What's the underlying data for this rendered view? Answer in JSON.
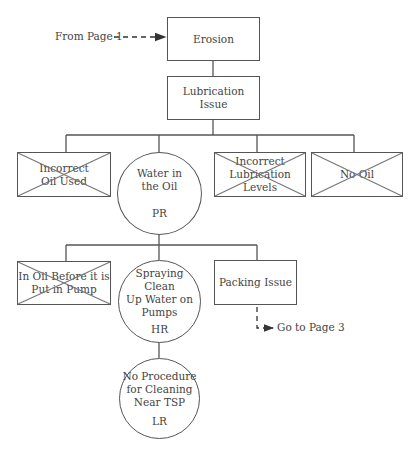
{
  "diagram": {
    "incoming": {
      "label": "From Page 1"
    },
    "outgoing": {
      "label": "Go to Page 3"
    },
    "nodes": {
      "erosion": {
        "label": "Erosion",
        "shape": "rectangle"
      },
      "lubrication_issue": {
        "label": "Lubrication Issue",
        "shape": "rectangle"
      },
      "incorrect_oil_used": {
        "label": "Incorrect Oil Used",
        "line1": "Incorrect",
        "line2": "Oil Used",
        "shape": "rectangle",
        "crossed_out": true
      },
      "water_in_oil": {
        "line1": "Water in",
        "line2": "the Oil",
        "rating": "PR",
        "shape": "circle"
      },
      "incorrect_lubrication_levels": {
        "line1": "Incorrect",
        "line2": "Lubrication Levels",
        "shape": "rectangle",
        "crossed_out": true
      },
      "no_oil": {
        "label": "No Oil",
        "shape": "rectangle",
        "crossed_out": true
      },
      "in_oil_before_pump": {
        "line1": "In Oil Before it is",
        "line2": "Put in Pump",
        "shape": "rectangle",
        "crossed_out": true
      },
      "spraying_clean_up_water": {
        "line1": "Spraying Clean",
        "line2": "Up Water on",
        "line3": "Pumps",
        "rating": "HR",
        "shape": "circle"
      },
      "packing_issue": {
        "label": "Packing Issue",
        "shape": "rectangle"
      },
      "no_procedure_cleaning": {
        "line1": "No Procedure",
        "line2": "for Cleaning",
        "line3": "Near TSP",
        "rating": "LR",
        "shape": "circle"
      }
    }
  }
}
